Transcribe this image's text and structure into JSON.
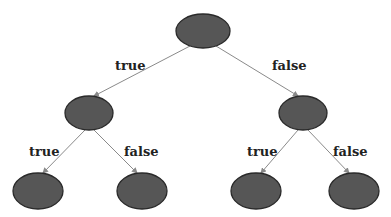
{
  "diagram": {
    "type": "binary-decision-tree",
    "colors": {
      "node_fill": "#565656",
      "node_stroke": "#2a2a2a",
      "edge": "#8a8a8a",
      "label": "#222222",
      "background": "#ffffff"
    },
    "nodes": [
      {
        "id": "root",
        "cx": 203,
        "cy": 31,
        "rx": 27,
        "ry": 17
      },
      {
        "id": "left",
        "cx": 89,
        "cy": 113,
        "rx": 24,
        "ry": 17
      },
      {
        "id": "right",
        "cx": 303,
        "cy": 113,
        "rx": 24,
        "ry": 17
      },
      {
        "id": "left-left",
        "cx": 38,
        "cy": 191,
        "rx": 25,
        "ry": 18
      },
      {
        "id": "left-right",
        "cx": 142,
        "cy": 191,
        "rx": 25,
        "ry": 18
      },
      {
        "id": "right-left",
        "cx": 256,
        "cy": 191,
        "rx": 25,
        "ry": 18
      },
      {
        "id": "right-right",
        "cx": 354,
        "cy": 191,
        "rx": 25,
        "ry": 18
      }
    ],
    "edges": [
      {
        "from": "root",
        "to": "left",
        "label": "true"
      },
      {
        "from": "root",
        "to": "right",
        "label": "false"
      },
      {
        "from": "left",
        "to": "left-left",
        "label": "true"
      },
      {
        "from": "left",
        "to": "left-right",
        "label": "false"
      },
      {
        "from": "right",
        "to": "right-left",
        "label": "true"
      },
      {
        "from": "right",
        "to": "right-right",
        "label": "false"
      }
    ],
    "labels": {
      "root_true": "true",
      "root_false": "false",
      "left_true": "true",
      "left_false": "false",
      "right_true": "true",
      "right_false": "false"
    }
  }
}
